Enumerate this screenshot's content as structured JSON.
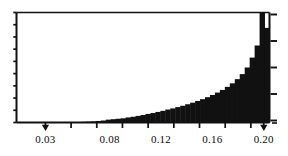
{
  "chart_data": {
    "type": "bar",
    "title": "",
    "subtitle": "",
    "xlabel": "",
    "ylabel": "",
    "xlim": [
      0.0075,
      0.2045
    ],
    "ylim": [
      0,
      1
    ],
    "grid": false,
    "legend": null,
    "annotations": [],
    "axis": {
      "x_tick_labels": [
        "0.03",
        "0.08",
        "0.12",
        "0.16",
        "0.20"
      ],
      "x_tick_values": [
        0.03,
        0.08,
        0.12,
        0.16,
        0.2
      ],
      "x_minor_tick_values": [
        0.03,
        0.05,
        0.07,
        0.09,
        0.11,
        0.13,
        0.15,
        0.17,
        0.19,
        0.2
      ],
      "y_tick_labels": [],
      "left_axis_minor_tick_count": 9,
      "right_axis_tick_count": 5,
      "tick_direction": "outward",
      "frame": "box"
    },
    "style": {
      "bar_color": "#111111",
      "axis_color": "#111111",
      "background": "#ffffff",
      "text_color": "#0b0b0b"
    },
    "bin_edges_note": "Bars are uniform-width bins spanning 0.0075 to 0.2045",
    "categories": [
      "0.008",
      "0.012",
      "0.016",
      "0.020",
      "0.024",
      "0.028",
      "0.032",
      "0.036",
      "0.040",
      "0.044",
      "0.048",
      "0.052",
      "0.056",
      "0.060",
      "0.064",
      "0.068",
      "0.072",
      "0.076",
      "0.080",
      "0.084",
      "0.088",
      "0.092",
      "0.096",
      "0.100",
      "0.104",
      "0.108",
      "0.112",
      "0.116",
      "0.120",
      "0.124",
      "0.128",
      "0.132",
      "0.136",
      "0.140",
      "0.144",
      "0.148",
      "0.152",
      "0.156",
      "0.160",
      "0.164",
      "0.168",
      "0.172",
      "0.176",
      "0.180",
      "0.184",
      "0.188",
      "0.192",
      "0.196",
      "0.198",
      "0.200",
      "0.202"
    ],
    "values": [
      0.0,
      0.0,
      0.0,
      0.0,
      0.0,
      0.0,
      0.0,
      0.0,
      0.0,
      0.0,
      0.0,
      0.0,
      0.004,
      0.006,
      0.008,
      0.01,
      0.014,
      0.018,
      0.026,
      0.03,
      0.034,
      0.038,
      0.046,
      0.052,
      0.06,
      0.068,
      0.078,
      0.086,
      0.096,
      0.106,
      0.118,
      0.128,
      0.14,
      0.152,
      0.166,
      0.18,
      0.196,
      0.212,
      0.23,
      0.25,
      0.272,
      0.296,
      0.324,
      0.356,
      0.394,
      0.44,
      0.5,
      0.59,
      0.7,
      1.0,
      0.86
    ]
  }
}
